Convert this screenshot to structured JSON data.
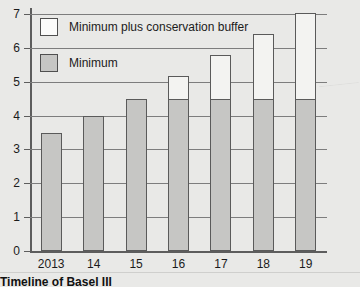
{
  "chart_data": {
    "type": "bar",
    "subtype": "stacked-bar",
    "title": "Timeline of Basel III",
    "xlabel": "",
    "ylabel": "",
    "categories": [
      "2013",
      "14",
      "15",
      "16",
      "17",
      "18",
      "19"
    ],
    "series": [
      {
        "name": "Minimum",
        "values": [
          3.5,
          4.0,
          4.5,
          4.5,
          4.5,
          4.5,
          4.5
        ],
        "color": "#c6c6c4"
      },
      {
        "name": "Minimum plus conservation buffer",
        "values": [
          3.5,
          4.0,
          4.5,
          5.125,
          5.75,
          6.375,
          7.0
        ],
        "color": "#f3f3f1"
      }
    ],
    "stack_tops": [
      3.5,
      4.0,
      4.5,
      5.125,
      5.75,
      6.375,
      7.0
    ],
    "ylim": [
      0,
      7
    ],
    "yticks": [
      0,
      1,
      2,
      3,
      4,
      5,
      6,
      7
    ],
    "ytick_labels": [
      "0",
      "1",
      "2",
      "3",
      "4",
      "5",
      "6",
      "7"
    ],
    "grid": true,
    "legend_position": "top-left"
  },
  "legend": {
    "items": [
      {
        "label": "Minimum plus conservation buffer",
        "swatch": "white"
      },
      {
        "label": "Minimum",
        "swatch": "gray"
      }
    ]
  },
  "caption": {
    "text": "Timeline of Basel III"
  }
}
